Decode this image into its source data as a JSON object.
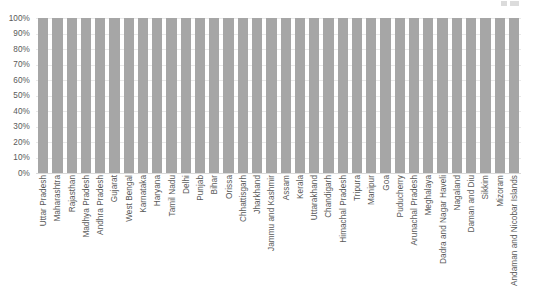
{
  "chart_data": {
    "type": "bar",
    "title": "",
    "subtitle": "",
    "xlabel": "",
    "ylabel": "",
    "ylim": [
      0,
      100
    ],
    "y_tick_labels": [
      "100%",
      "90%",
      "80%",
      "70%",
      "60%",
      "50%",
      "40%",
      "30%",
      "20%",
      "10%",
      "0%"
    ],
    "y_tick_values": [
      100,
      90,
      80,
      70,
      60,
      50,
      40,
      30,
      20,
      10,
      0
    ],
    "grid": true,
    "grid_axis": "y",
    "legend": "none",
    "bar_color": "#a6a6a6",
    "categories": [
      "Uttar Pradesh",
      "Maharashtra",
      "Rajasthan",
      "Madhya Pradesh",
      "Andhra Pradesh",
      "Gujarat",
      "West Bengal",
      "Karnataka",
      "Haryana",
      "Tamil Nadu",
      "Delhi",
      "Punjab",
      "Bihar",
      "Orissa",
      "Chhattisgarh",
      "Jharkhand",
      "Jammu and Kashmir",
      "Assam",
      "Kerala",
      "Uttarakhand",
      "Chandigarh",
      "Himachal Pradesh",
      "Tripura",
      "Manipur",
      "Goa",
      "Puducherry",
      "Arunachal Pradesh",
      "Meghalaya",
      "Dadra and Nagar Haveli",
      "Nagaland",
      "Daman and Diu",
      "Sikkim",
      "Mizoram",
      "Andaman and Nicobar Islands"
    ],
    "values": [
      100,
      100,
      100,
      100,
      100,
      100,
      100,
      100,
      100,
      100,
      100,
      100,
      100,
      100,
      100,
      100,
      100,
      100,
      100,
      100,
      100,
      100,
      100,
      100,
      100,
      100,
      100,
      100,
      100,
      100,
      100,
      100,
      100,
      100
    ]
  },
  "artifact": {
    "description": "cut-off-marks"
  }
}
